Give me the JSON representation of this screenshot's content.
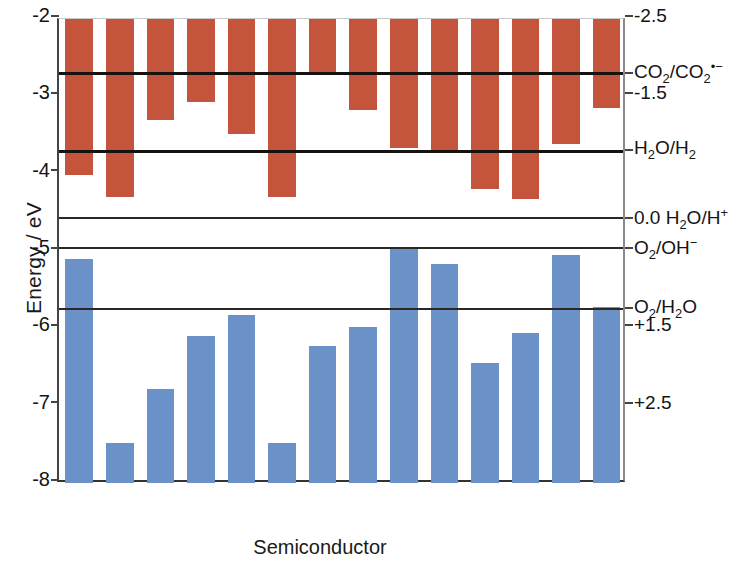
{
  "chart_data": {
    "type": "bar",
    "title": "",
    "xlabel": "Semiconductor",
    "ylabel": "Energy / eV",
    "ylabel_right": "Standard Reduction Potential / V",
    "ylim": [
      -8,
      -2
    ],
    "yticks": [
      "-2",
      "-3",
      "-4",
      "-5",
      "-6",
      "-7",
      "-8"
    ],
    "ytick_values": [
      -2,
      -3,
      -4,
      -5,
      -6,
      -7,
      -8
    ],
    "right_axis_ticks": [
      {
        "label": "-2.5",
        "energy": -2.0
      },
      {
        "label": "-1.5",
        "energy": -3.0
      },
      {
        "label": "0.0  H₂O/H⁺",
        "energy": -4.58
      },
      {
        "label": "+1.5",
        "energy": -6.0
      },
      {
        "label": "+2.5",
        "energy": -7.0
      }
    ],
    "grid": false,
    "legend": "none",
    "categories": [
      "Si",
      "TiO₂",
      "GaN",
      "SiC",
      "GaP",
      "ZnO",
      "ZnS",
      "ZnSe",
      "ZnTe",
      "CuInS₂",
      "CdS",
      "CdSe",
      "CdTe",
      "Cu₂O"
    ],
    "series": [
      {
        "name": "Conduction band edge (top of red bar fixed at -2.0 eV, bottom = CB edge)",
        "color": "#c4553c",
        "top": -2.0,
        "values": [
          -4.02,
          -4.3,
          -3.3,
          -3.07,
          -3.49,
          -4.3,
          -2.68,
          -3.18,
          -3.67,
          -3.72,
          -4.2,
          -4.33,
          -3.62,
          -3.15
        ]
      },
      {
        "name": "Valence band edge (top = VB edge, bottom fixed at -8.0 eV)",
        "color": "#6a92c8",
        "bottom": -8.0,
        "values": [
          -5.1,
          -7.48,
          -6.78,
          -6.1,
          -5.83,
          -7.48,
          -6.23,
          -5.98,
          -4.98,
          -5.17,
          -6.45,
          -6.06,
          -5.05,
          -5.73
        ]
      }
    ],
    "reference_lines": [
      {
        "label": "CO₂/CO₂•⁻",
        "energy": -2.7
      },
      {
        "label": "H₂O/H₂",
        "energy": -3.71
      },
      {
        "label": "0.0  H₂O/H⁺",
        "energy": -4.58
      },
      {
        "label": "O₂/OH⁻",
        "energy": -4.97
      },
      {
        "label": "O₂/H₂O",
        "energy": -5.76
      }
    ]
  },
  "colors": {
    "conduction_band": "#c4553c",
    "valence_band": "#6a92c8",
    "reference_line": "#15120f",
    "axis": "#333333",
    "text": "#141414"
  }
}
